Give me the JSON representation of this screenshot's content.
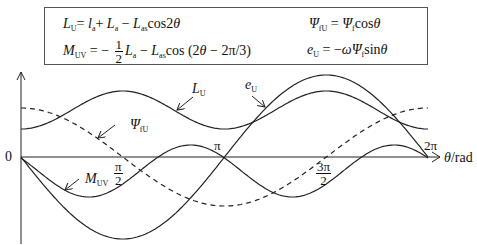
{
  "equations": {
    "L_U": {
      "lhs": "L",
      "lhs_sub": "U",
      "rhs": "= l_a + L_a − L_as cos2θ"
    },
    "M_UV": {
      "lhs": "M",
      "lhs_sub": "UV",
      "rhs": "= −(1/2) L_a − L_as cos (2θ − 2π/3)"
    },
    "psi_fU": {
      "lhs": "Ψ",
      "lhs_sub": "fU",
      "rhs": "= Ψ_f cosθ"
    },
    "e_U": {
      "lhs": "e",
      "lhs_sub": "U",
      "rhs": "= −ωΨ_f sinθ"
    }
  },
  "eq_parts": {
    "eq1_a": "L",
    "eq1_a_sub": "U",
    "eq1_b": "= ",
    "eq1_c": "l",
    "eq1_c_sub": "a",
    "eq1_d": "+ ",
    "eq1_e": "L",
    "eq1_e_sub": "a",
    "eq1_f": " − ",
    "eq1_g": "L",
    "eq1_g_sub": "as",
    "eq1_h": "cos2",
    "eq1_i": "θ",
    "eq2_a": "M",
    "eq2_a_sub": "UV",
    "eq2_b": " = − ",
    "eq2_num": "1",
    "eq2_den": "2",
    "eq2_c": "L",
    "eq2_c_sub": "a",
    "eq2_d": " − ",
    "eq2_e": "L",
    "eq2_e_sub": "as",
    "eq2_f": "cos (2",
    "eq2_g": "θ",
    "eq2_h": " − 2π/3)",
    "eq3_a": "Ψ",
    "eq3_a_sub": "fU",
    "eq3_b": " = ",
    "eq3_c": "Ψ",
    "eq3_c_sub": "f",
    "eq3_d": "cos",
    "eq3_e": "θ",
    "eq4_a": "e",
    "eq4_a_sub": "U",
    "eq4_b": " = −",
    "eq4_c": "ωΨ",
    "eq4_c_sub": "f",
    "eq4_d": "sin",
    "eq4_e": "θ"
  },
  "axis": {
    "origin_label": "0",
    "x_label_var": "θ",
    "x_label_unit": "/rad",
    "ticks": [
      {
        "label_num": "π",
        "label_den": "2"
      },
      {
        "label": "π"
      },
      {
        "label_num": "3π",
        "label_den": "2"
      },
      {
        "label": "2π"
      }
    ]
  },
  "curve_labels": {
    "L_U": {
      "main": "L",
      "sub": "U"
    },
    "e_U": {
      "main": "e",
      "sub": "U"
    },
    "psi_fU": {
      "main": "Ψ",
      "sub": "fU"
    },
    "M_UV": {
      "main": "M",
      "sub": "UV"
    }
  },
  "chart_data": {
    "type": "line",
    "title": "",
    "xlabel": "θ/rad",
    "ylabel": "",
    "x_ticks": [
      "0",
      "π/2",
      "π",
      "3π/2",
      "2π"
    ],
    "series": [
      {
        "name": "L_U",
        "style": "solid",
        "formula": "l_a + L_a − L_as cos2θ",
        "x": [
          "0",
          "π/2",
          "π",
          "3π/2",
          "2π"
        ],
        "relative_values": [
          0.35,
          0.85,
          0.35,
          0.85,
          0.35
        ]
      },
      {
        "name": "M_UV",
        "style": "solid",
        "formula": "−(1/2)L_a − L_as cos(2θ − 2π/3)",
        "relative_values_note": "oscillates below axis, max ≈ 0 near θ≈5π/6 and 11π/6"
      },
      {
        "name": "Ψ_fU",
        "style": "dashed",
        "formula": "Ψ_f cosθ",
        "x": [
          "0",
          "π/2",
          "π",
          "3π/2",
          "2π"
        ],
        "relative_values": [
          0.6,
          0,
          -0.6,
          0,
          0.6
        ]
      },
      {
        "name": "e_U",
        "style": "solid",
        "formula": "−ωΨ_f sinθ",
        "x": [
          "0",
          "π/2",
          "π",
          "3π/2",
          "2π"
        ],
        "relative_values": [
          0,
          -1,
          0,
          1,
          0
        ]
      }
    ],
    "grid": false,
    "legend": "inline labels with leader arrows"
  }
}
